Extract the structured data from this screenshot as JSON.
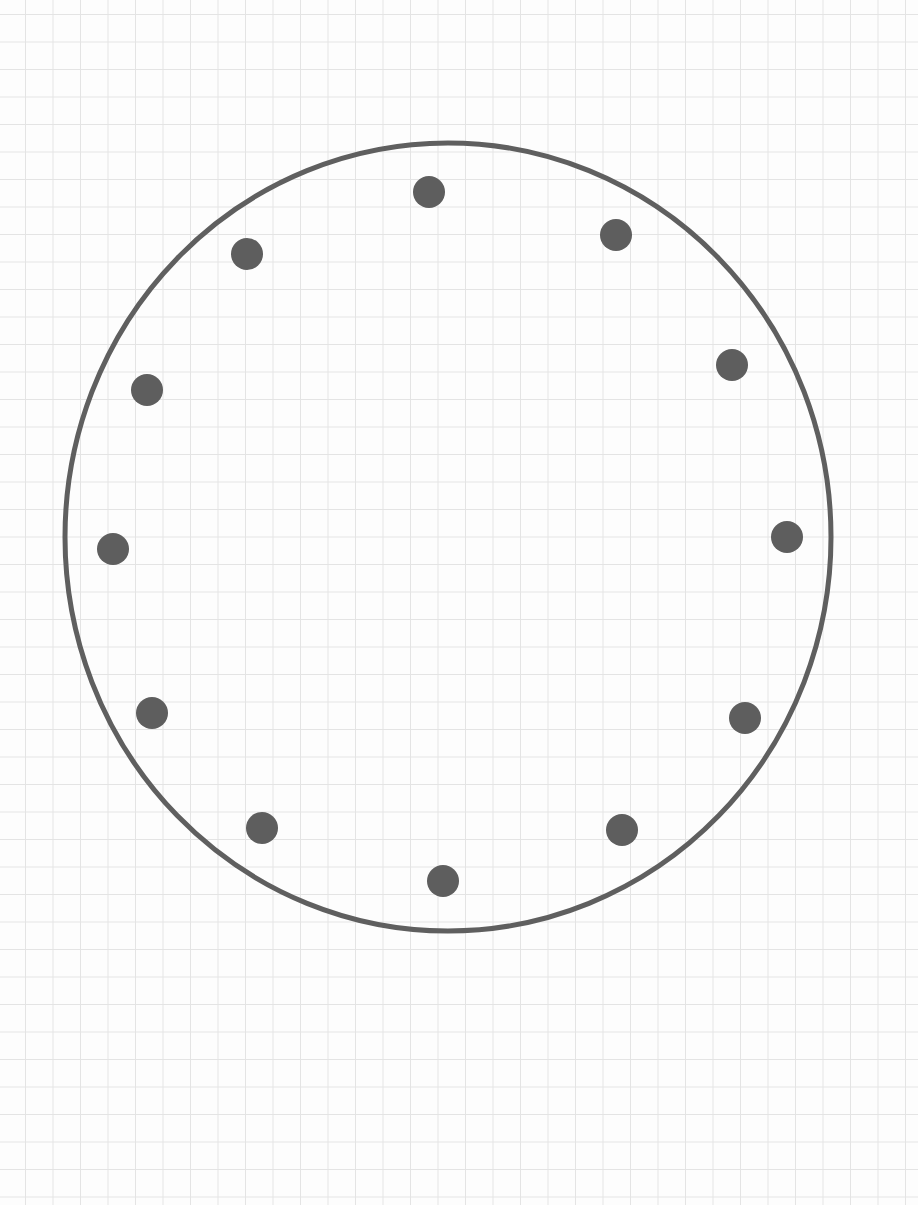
{
  "diagram": {
    "colors": {
      "circle_stroke": "#5f5f5f",
      "dot_fill": "#5e5e5e",
      "grid": "#e4e4e4",
      "background": "#fdfdfd"
    },
    "circle": {
      "cx": 448,
      "cy": 537,
      "rx": 383,
      "ry": 394,
      "stroke_width": 5
    },
    "dot_radius": 16,
    "dots": [
      {
        "x": 429,
        "y": 192
      },
      {
        "x": 616,
        "y": 235
      },
      {
        "x": 732,
        "y": 365
      },
      {
        "x": 787,
        "y": 537
      },
      {
        "x": 745,
        "y": 718
      },
      {
        "x": 622,
        "y": 830
      },
      {
        "x": 443,
        "y": 881
      },
      {
        "x": 262,
        "y": 828
      },
      {
        "x": 152,
        "y": 713
      },
      {
        "x": 113,
        "y": 549
      },
      {
        "x": 147,
        "y": 390
      },
      {
        "x": 247,
        "y": 254
      }
    ]
  }
}
